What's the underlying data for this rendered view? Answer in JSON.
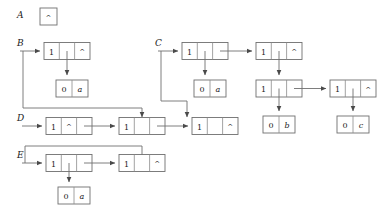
{
  "figure": {
    "kind": "linked-list-cons-cell-diagram",
    "background_color": "#ffffff",
    "line_color": "#6f6f6f",
    "text_color": "#1a1a1a",
    "nil_glyph": "^",
    "width": 387,
    "height": 220
  },
  "variables": [
    {
      "id": "A",
      "label": "A"
    },
    {
      "id": "B",
      "label": "B"
    },
    {
      "id": "C",
      "label": "C"
    },
    {
      "id": "D",
      "label": "D"
    },
    {
      "id": "E",
      "label": "E"
    }
  ],
  "nodes": {
    "a_nil": {
      "cells": [
        "^"
      ]
    },
    "b_head": {
      "cells": [
        "1",
        "",
        "^"
      ]
    },
    "b_leaf": {
      "cells": [
        "0",
        "a"
      ]
    },
    "c_head": {
      "cells": [
        "1",
        "",
        ""
      ]
    },
    "c_leaf": {
      "cells": [
        "0",
        "a"
      ]
    },
    "c_r1": {
      "cells": [
        "1",
        "",
        "^"
      ]
    },
    "c_r2": {
      "cells": [
        "1",
        "",
        ""
      ]
    },
    "c_r3": {
      "cells": [
        "1",
        "",
        "^"
      ]
    },
    "c_leaf_b": {
      "cells": [
        "0",
        "b"
      ]
    },
    "c_leaf_c": {
      "cells": [
        "0",
        "c"
      ]
    },
    "d_n1": {
      "cells": [
        "1",
        "^",
        ""
      ]
    },
    "d_n2": {
      "cells": [
        "1",
        "",
        ""
      ]
    },
    "d_n3": {
      "cells": [
        "1",
        "",
        "^"
      ]
    },
    "e_n1": {
      "cells": [
        "1",
        "",
        ""
      ]
    },
    "e_n2": {
      "cells": [
        "1",
        "",
        "^"
      ]
    },
    "e_leaf": {
      "cells": [
        "0",
        "a"
      ]
    }
  },
  "cell_values": {
    "one": "1",
    "zero": "0",
    "nil": "^",
    "atom_a": "a",
    "atom_b": "b",
    "atom_c": "c"
  }
}
